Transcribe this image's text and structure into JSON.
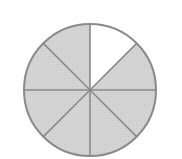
{
  "diagram": {
    "type": "fraction-circle",
    "total_parts": 8,
    "shaded_parts": 7,
    "unshaded_parts": 1,
    "fraction_shaded": "7/8",
    "unshaded_sector_index": 0,
    "colors": {
      "shaded_fill": "#d2d2d2",
      "unshaded_fill": "#ffffff",
      "line": "#8a8a8a",
      "background": "#ffffff"
    },
    "geometry": {
      "cx": 90,
      "cy": 90,
      "r": 66
    }
  }
}
